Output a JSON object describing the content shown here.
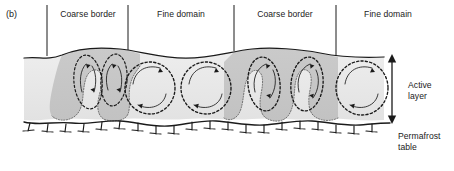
{
  "figure": {
    "panel_letter": "(b)",
    "top_labels": [
      {
        "text": "Coarse border",
        "x": 88,
        "y": 9
      },
      {
        "text": "Fine domain",
        "x": 181,
        "y": 9
      },
      {
        "text": "Coarse border",
        "x": 285,
        "y": 9
      },
      {
        "text": "Fine domain",
        "x": 388,
        "y": 9
      }
    ],
    "annotations": {
      "active_layer": "Active\nlayer",
      "permafrost_table": "Permafrost\ntable"
    },
    "colors": {
      "coarse_border_fill": "#c9c9c9",
      "fine_domain_fill": "#e9e9e9",
      "fine_domain_fill_light": "#efefef",
      "outline": "#1a1a1a",
      "flow_arrow": "#1a1a1a",
      "background": "#ffffff"
    },
    "diagram_type": "cross-section",
    "geometry": {
      "surface_y_crest": 51,
      "surface_y_trough": 60,
      "permafrost_table_y": 122,
      "active_layer_arrow": {
        "x": 392,
        "y_top": 56,
        "y_bottom": 122
      },
      "domain_separators_x": [
        47,
        128,
        234,
        336
      ],
      "separator_y_top": 5,
      "separator_y_bottom": 56
    },
    "convection_cells": [
      {
        "domain": "coarse-border",
        "cx": 88,
        "cy": 82,
        "rx": 15,
        "ry": 30,
        "rotation": "clockwise"
      },
      {
        "domain": "coarse-border",
        "cx": 114,
        "cy": 80,
        "rx": 14,
        "ry": 29,
        "rotation": "counter-clockwise"
      },
      {
        "domain": "fine-domain",
        "cx": 150,
        "cy": 88,
        "rx": 26,
        "ry": 26,
        "rotation": "counter-clockwise"
      },
      {
        "domain": "fine-domain",
        "cx": 206,
        "cy": 88,
        "rx": 26,
        "ry": 26,
        "rotation": "counter-clockwise"
      },
      {
        "domain": "coarse-border",
        "cx": 264,
        "cy": 83,
        "rx": 17,
        "ry": 28,
        "rotation": "clockwise"
      },
      {
        "domain": "coarse-border",
        "cx": 307,
        "cy": 83,
        "rx": 17,
        "ry": 28,
        "rotation": "counter-clockwise"
      },
      {
        "domain": "fine-domain",
        "cx": 362,
        "cy": 88,
        "rx": 27,
        "ry": 27,
        "rotation": "counter-clockwise"
      }
    ]
  }
}
